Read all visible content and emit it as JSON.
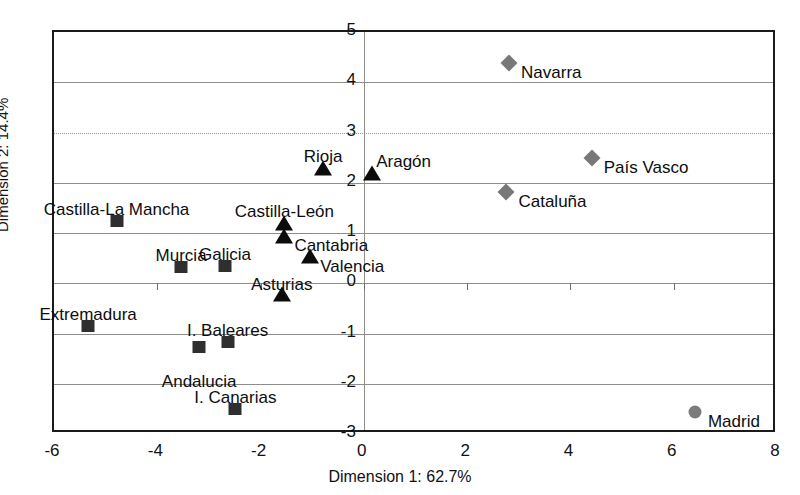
{
  "axes": {
    "x_title": "Dimension 1: 62.7%",
    "y_title": "Dimension 2: 14.4%",
    "x_ticks": [
      "-6",
      "-4",
      "-2",
      "0",
      "2",
      "4",
      "6",
      "8"
    ],
    "y_ticks": [
      "5",
      "4",
      "3",
      "2",
      "1",
      "0",
      "-1",
      "-2",
      "-3"
    ]
  },
  "colors": {
    "frame": "#1b1b1b",
    "grid": "#8d8d8d",
    "triangle": "#0c0c0c",
    "square": "#2f2f2f",
    "diamond": "#787878",
    "circle": "#7c7c7c",
    "text": "#0d0d0d",
    "background": "#ffffff"
  },
  "chart_data": {
    "type": "scatter",
    "title": "",
    "xlabel": "Dimension 1: 62.7%",
    "ylabel": "Dimension 2: 14.4%",
    "xlim": [
      -6,
      8
    ],
    "ylim": [
      -3,
      5
    ],
    "xticks": [
      -6,
      -4,
      -2,
      0,
      2,
      4,
      6,
      8
    ],
    "yticks": [
      -3,
      -2,
      -1,
      0,
      1,
      2,
      3,
      4,
      5
    ],
    "grid": true,
    "legend": "none",
    "series": [
      {
        "name": "triangle-group",
        "marker": "triangle",
        "color": "#0c0c0c",
        "points": [
          {
            "label": "Rioja",
            "x": -0.75,
            "y": 2.25,
            "label_dx": 0,
            "label_dy": -20,
            "anchor": "center"
          },
          {
            "label": "Aragón",
            "x": 0.2,
            "y": 2.15,
            "label_dx": 4,
            "label_dy": -20,
            "anchor": "start"
          },
          {
            "label": "Castilla-León",
            "x": -1.5,
            "y": 1.15,
            "label_dx": 0,
            "label_dy": -20,
            "anchor": "center"
          },
          {
            "label": "Cantabria",
            "x": -1.5,
            "y": 0.9,
            "label_dx": 10,
            "label_dy": 1,
            "anchor": "start"
          },
          {
            "label": "Valencia",
            "x": -1.0,
            "y": 0.5,
            "label_dx": 10,
            "label_dy": 2,
            "anchor": "start"
          },
          {
            "label": "Asturias",
            "x": -1.55,
            "y": -0.25,
            "label_dx": 0,
            "label_dy": -18,
            "anchor": "center"
          }
        ]
      },
      {
        "name": "square-group",
        "marker": "square",
        "color": "#2f2f2f",
        "points": [
          {
            "label": "Castilla-La Mancha",
            "x": -4.75,
            "y": 1.2,
            "label_dx": 0,
            "label_dy": -20,
            "anchor": "center"
          },
          {
            "label": "Murcia",
            "x": -3.5,
            "y": 0.28,
            "label_dx": 0,
            "label_dy": -20,
            "anchor": "center"
          },
          {
            "label": "Galicia",
            "x": -2.65,
            "y": 0.3,
            "label_dx": 0,
            "label_dy": -20,
            "anchor": "center"
          },
          {
            "label": "Extremadura",
            "x": -5.3,
            "y": -0.9,
            "label_dx": 0,
            "label_dy": -20,
            "anchor": "center"
          },
          {
            "label": "I. Baleares",
            "x": -2.6,
            "y": -1.2,
            "label_dx": 0,
            "label_dy": -20,
            "anchor": "center"
          },
          {
            "label": "Andalucia",
            "x": -3.15,
            "y": -1.3,
            "label_dx": 0,
            "label_dy": 26,
            "anchor": "center"
          },
          {
            "label": "I. Canarias",
            "x": -2.45,
            "y": -2.55,
            "label_dx": 0,
            "label_dy": -20,
            "anchor": "center"
          }
        ]
      },
      {
        "name": "diamond-group",
        "marker": "diamond",
        "color": "#787878",
        "points": [
          {
            "label": "Navarra",
            "x": 2.85,
            "y": 4.35,
            "label_dx": 12,
            "label_dy": 1,
            "anchor": "start"
          },
          {
            "label": "País Vasco",
            "x": 4.45,
            "y": 2.45,
            "label_dx": 12,
            "label_dy": 1,
            "anchor": "start"
          },
          {
            "label": "Cataluña",
            "x": 2.8,
            "y": 1.78,
            "label_dx": 12,
            "label_dy": 1,
            "anchor": "start"
          }
        ]
      },
      {
        "name": "circle-group",
        "marker": "circle",
        "color": "#7c7c7c",
        "points": [
          {
            "label": "Madrid",
            "x": 6.45,
            "y": -2.6,
            "label_dx": 13,
            "label_dy": 1,
            "anchor": "start"
          }
        ]
      }
    ]
  }
}
